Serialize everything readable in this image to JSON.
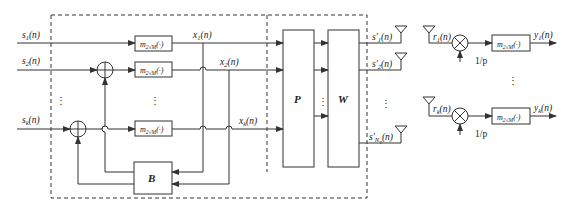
{
  "diagram": {
    "type": "block-diagram",
    "colors": {
      "line": "#333333",
      "background": "#ffffff"
    },
    "inputs": [
      {
        "id": "s1",
        "label": "s",
        "sub": "1",
        "arg": "(n)"
      },
      {
        "id": "s2",
        "label": "s",
        "sub": "2",
        "arg": "(n)"
      },
      {
        "id": "sk",
        "label": "s",
        "sub": "k",
        "arg": "(n)"
      }
    ],
    "modulo_label": {
      "base": "m",
      "sub": "2√M",
      "arg": "(·)"
    },
    "intermediate": [
      {
        "id": "x1",
        "label": "x",
        "sub": "1",
        "arg": "(n)"
      },
      {
        "id": "x2",
        "label": "x",
        "sub": "2",
        "arg": "(n)"
      },
      {
        "id": "xk",
        "label": "x",
        "sub": "k",
        "arg": "(n)"
      }
    ],
    "blocks": {
      "feedback": "B",
      "permutation": "P",
      "precoder": "W"
    },
    "tx_outputs": [
      {
        "id": "s1p",
        "label": "s′",
        "sub": "1",
        "arg": "(n)"
      },
      {
        "id": "s2p",
        "label": "s′",
        "sub": "2",
        "arg": "(n)"
      },
      {
        "id": "sNt",
        "label": "s′",
        "sub": "N",
        "subsub": "T",
        "arg": "(n)"
      }
    ],
    "receivers": [
      {
        "id": "rx1",
        "in_label": "r",
        "in_sub": "1",
        "in_arg": "(n)",
        "gain": "1/p",
        "out_label": "y",
        "out_sub": "1",
        "out_arg": "(n)"
      },
      {
        "id": "rxk",
        "in_label": "r",
        "in_sub": "k",
        "in_arg": "(n)",
        "gain": "1/p",
        "out_label": "y",
        "out_sub": "k",
        "out_arg": "(n)"
      }
    ],
    "ellipsis": "⋮"
  }
}
